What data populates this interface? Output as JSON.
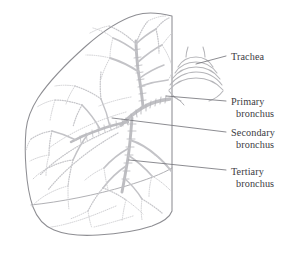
{
  "figure": {
    "background_color": "#ffffff",
    "outline_color": "#8e8e93",
    "bronchi_color": "#b9b9bd",
    "leader_color": "#6f6f75",
    "text_color": "#3b3b3f"
  },
  "labels": [
    {
      "id": "trachea",
      "line1": "Trachea",
      "line2": "",
      "leader": {
        "x1": 226,
        "y1": 56,
        "x2": 196,
        "y2": 64
      }
    },
    {
      "id": "primary-bronchus",
      "line1": "Primary",
      "line2": "bronchus",
      "leader": {
        "x1": 226,
        "y1": 101,
        "x2": 166,
        "y2": 96
      }
    },
    {
      "id": "secondary-bronchus",
      "line1": "Secondary",
      "line2": "bronchus",
      "leader": {
        "x1": 226,
        "y1": 132,
        "x2": 112,
        "y2": 118
      }
    },
    {
      "id": "tertiary-bronchus",
      "line1": "Tertiary",
      "line2": "bronchus",
      "leader": {
        "x1": 226,
        "y1": 170,
        "x2": 129,
        "y2": 160
      }
    }
  ],
  "anatomy": {
    "lung_label": "lung-outline",
    "trachea_label": "trachea-cartilage-rings",
    "bronchial_tree_label": "bronchial-tree"
  }
}
